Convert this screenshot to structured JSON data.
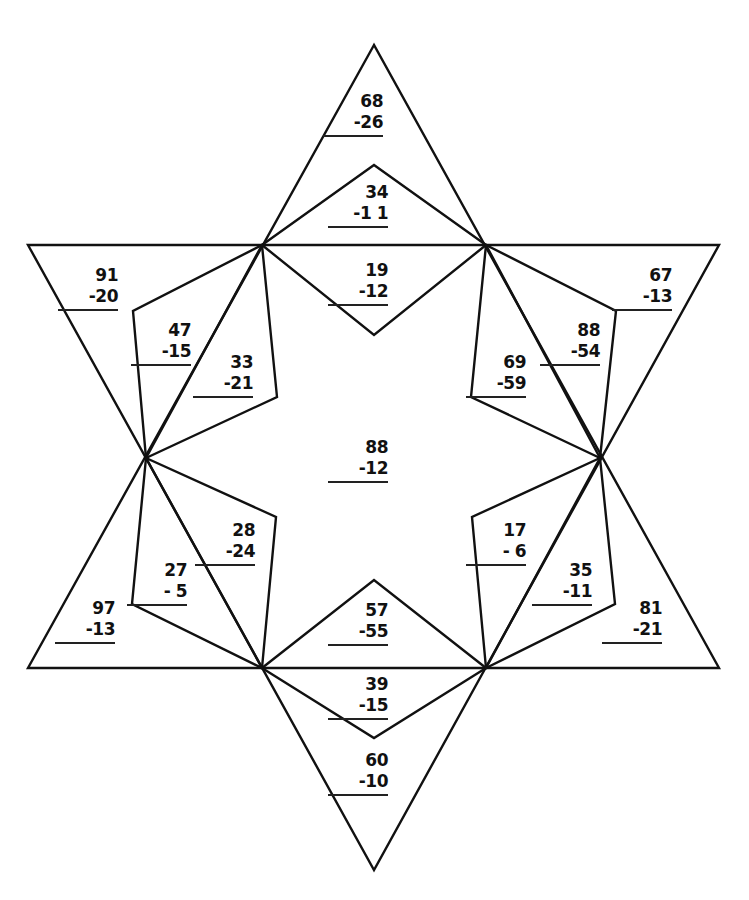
{
  "worksheet": {
    "type": "subtraction star puzzle",
    "line_color": "#111111",
    "problems": [
      {
        "id": "top-tip",
        "minuend": "68",
        "subtrahend": "-26",
        "x": 323,
        "y": 91
      },
      {
        "id": "top-kite-upper",
        "minuend": "34",
        "subtrahend": "-1 1",
        "x": 328,
        "y": 182
      },
      {
        "id": "top-kite-lower",
        "minuend": "19",
        "subtrahend": "-12",
        "x": 328,
        "y": 260
      },
      {
        "id": "upper-left-tip",
        "minuend": "91",
        "subtrahend": "-20",
        "x": 58,
        "y": 265
      },
      {
        "id": "upper-left-kite-outer",
        "minuend": "47",
        "subtrahend": "-15",
        "x": 131,
        "y": 320
      },
      {
        "id": "upper-left-kite-inner",
        "minuend": "33",
        "subtrahend": "-21",
        "x": 193,
        "y": 352
      },
      {
        "id": "upper-right-tip",
        "minuend": "67",
        "subtrahend": "-13",
        "x": 612,
        "y": 265
      },
      {
        "id": "upper-right-kite-outer",
        "minuend": "88",
        "subtrahend": "-54",
        "x": 540,
        "y": 320
      },
      {
        "id": "upper-right-kite-inner",
        "minuend": "69",
        "subtrahend": "-59",
        "x": 466,
        "y": 352
      },
      {
        "id": "center",
        "minuend": "88",
        "subtrahend": "-12",
        "x": 328,
        "y": 437
      },
      {
        "id": "lower-left-kite-inner",
        "minuend": "28",
        "subtrahend": "-24",
        "x": 195,
        "y": 520
      },
      {
        "id": "lower-left-kite-outer",
        "minuend": "27",
        "subtrahend": "- 5",
        "x": 127,
        "y": 560
      },
      {
        "id": "lower-left-tip",
        "minuend": "97",
        "subtrahend": "-13",
        "x": 55,
        "y": 598
      },
      {
        "id": "lower-right-kite-inner",
        "minuend": "17",
        "subtrahend": "- 6",
        "x": 466,
        "y": 520
      },
      {
        "id": "lower-right-kite-outer",
        "minuend": "35",
        "subtrahend": "-11",
        "x": 532,
        "y": 560
      },
      {
        "id": "lower-right-tip",
        "minuend": "81",
        "subtrahend": "-21",
        "x": 602,
        "y": 598
      },
      {
        "id": "bottom-kite-upper",
        "minuend": "57",
        "subtrahend": "-55",
        "x": 328,
        "y": 600
      },
      {
        "id": "bottom-kite-lower",
        "minuend": "39",
        "subtrahend": "-15",
        "x": 328,
        "y": 674
      },
      {
        "id": "bottom-tip",
        "minuend": "60",
        "subtrahend": "-10",
        "x": 328,
        "y": 750
      }
    ]
  }
}
